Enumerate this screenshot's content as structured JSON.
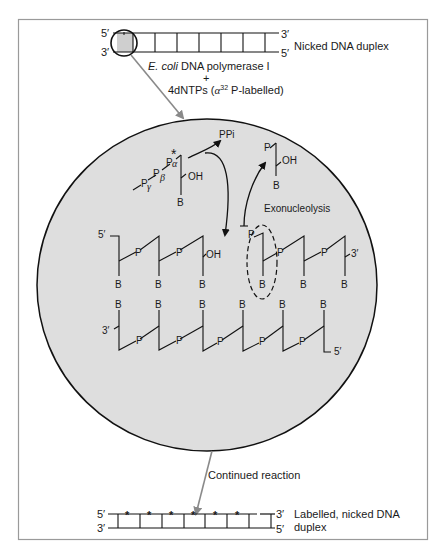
{
  "colors": {
    "frame": "#8c8c8c",
    "circle_fill": "#dedede",
    "circle_stroke": "#111111",
    "arrow_gray": "#8a8a8a",
    "ink": "#1a1a1a",
    "nick_box": "#cfcfcf"
  },
  "top_duplex": {
    "label": "Nicked DNA duplex",
    "top_left": "5′",
    "bottom_left": "3′",
    "top_right": "3′",
    "bottom_right": "5′"
  },
  "reagents": {
    "enzyme_italic": "E. coli",
    "enzyme_rest": " DNA polymerase I",
    "plus": "+",
    "dntp_prefix": "4dNTPs (",
    "dntp_alpha": "α",
    "dntp_sup": "32",
    "dntp_suffix": " P-labelled)"
  },
  "inset": {
    "ppi": "PPi",
    "incoming": {
      "p_gamma": "P",
      "gamma": "γ",
      "p_beta": "P",
      "beta": "β",
      "p_alpha": "P",
      "alpha": "α",
      "star": "*",
      "oh": "OH",
      "base": "B"
    },
    "released": {
      "p": "P",
      "oh": "OH",
      "base": "B"
    },
    "exonucleolysis": "Exonucleolysis",
    "upper_strand": {
      "left_end": "5′",
      "right_end": "3′",
      "oh": "OH",
      "p": "P",
      "base": "B"
    },
    "lower_strand": {
      "left_end": "3′",
      "right_end": "5′",
      "p": "P",
      "base": "B"
    }
  },
  "continued": "Continued reaction",
  "bottom_duplex": {
    "label_line1": "Labelled, nicked DNA",
    "label_line2": "duplex",
    "top_left": "5′",
    "bottom_left": "3′",
    "top_right": "3′",
    "bottom_right": "5′",
    "star": "*"
  }
}
